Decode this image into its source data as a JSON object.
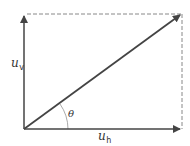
{
  "diagram": {
    "type": "vector-decomposition",
    "colors": {
      "line": "#444444",
      "dashed": "#888888",
      "arc": "#aaaaaa",
      "text": "#333333"
    },
    "labels": {
      "vertical_main": "u",
      "vertical_sub": "v",
      "horizontal_main": "u",
      "horizontal_sub": "h",
      "angle": "θ"
    },
    "geometry": {
      "origin": [
        24,
        129
      ],
      "vertical_tip": [
        24,
        14
      ],
      "horizontal_tip": [
        182,
        129
      ],
      "resultant_tip": [
        182,
        14
      ]
    }
  }
}
